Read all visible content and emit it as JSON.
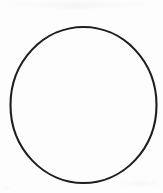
{
  "document": {
    "type": "scanned-line-drawing",
    "title": "",
    "caption": "",
    "width": 163,
    "height": 193,
    "background_color": "#fdfdfd",
    "page_color": "#ffffff"
  },
  "figure": {
    "name": "circle",
    "shape_label": "circle",
    "stroke_color": "#1e1e1e",
    "fill_color": "none",
    "stroke_width": 2.1,
    "geometry": {
      "center_x": 83.5,
      "center_y": 105,
      "radius_x": 73,
      "radius_y": 78,
      "left": 10.5,
      "right": 156.5,
      "top": 27,
      "bottom": 183
    }
  },
  "artifacts": {
    "smudge_color": "#f0f0f0",
    "marks": [
      {
        "name": "top-edge-smudge",
        "x": 4,
        "y": 0,
        "width": 150,
        "height": 9,
        "opacity": 0.5
      },
      {
        "name": "top-center-smudge",
        "x": 46,
        "y": 4,
        "width": 60,
        "height": 6,
        "opacity": 0.45
      },
      {
        "name": "bottom-right-smudge",
        "x": 120,
        "y": 179,
        "width": 40,
        "height": 9,
        "opacity": 0.5
      },
      {
        "name": "bottom-left-speck",
        "x": 2,
        "y": 186,
        "width": 10,
        "height": 4,
        "opacity": 0.35
      }
    ]
  },
  "text_content": {
    "labels": [],
    "annotations": [],
    "note": "no text present in image"
  }
}
